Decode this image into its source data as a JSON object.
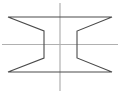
{
  "canvas": {
    "width": 120,
    "height": 94,
    "background_color": "#ffffff"
  },
  "drawing": {
    "title": "Spool cross-section outline",
    "description": "Symmetric hourglass / bowtie profile with centerlines",
    "outline_color": "#4a4a4a",
    "outline_width": 1.1,
    "centerline_color": "#b0b0b0",
    "centerline_width": 1.2,
    "profile_points": [
      [
        8,
        17
      ],
      [
        112,
        17
      ],
      [
        77,
        31
      ],
      [
        77,
        58
      ],
      [
        112,
        72
      ],
      [
        8,
        72
      ],
      [
        44,
        58
      ],
      [
        44,
        31
      ]
    ],
    "outline_path": "M 8 17 L 112 17 L 77 31 L 77 58 L 112 72 L 8 72 L 44 58 L 44 31 Z",
    "segments": [
      {
        "name": "top-edge",
        "x1": 8,
        "y1": 17,
        "x2": 112,
        "y2": 17
      },
      {
        "name": "upper-right-diagonal",
        "x1": 112,
        "y1": 17,
        "x2": 77,
        "y2": 31
      },
      {
        "name": "right-waist-vertical",
        "x1": 77,
        "y1": 31,
        "x2": 77,
        "y2": 58
      },
      {
        "name": "lower-right-diagonal",
        "x1": 77,
        "y1": 58,
        "x2": 112,
        "y2": 72
      },
      {
        "name": "bottom-edge",
        "x1": 112,
        "y1": 72,
        "x2": 8,
        "y2": 72
      },
      {
        "name": "lower-left-diagonal",
        "x1": 8,
        "y1": 72,
        "x2": 44,
        "y2": 58
      },
      {
        "name": "left-waist-vertical",
        "x1": 44,
        "y1": 58,
        "x2": 44,
        "y2": 31
      },
      {
        "name": "upper-left-diagonal",
        "x1": 44,
        "y1": 31,
        "x2": 8,
        "y2": 17
      }
    ],
    "centerlines": [
      {
        "name": "horizontal-centerline",
        "orientation": "horizontal",
        "x1": 2,
        "y1": 44.5,
        "x2": 118,
        "y2": 44.5
      },
      {
        "name": "vertical-centerline",
        "orientation": "vertical",
        "x1": 60,
        "y1": 3,
        "x2": 60,
        "y2": 91
      }
    ]
  }
}
